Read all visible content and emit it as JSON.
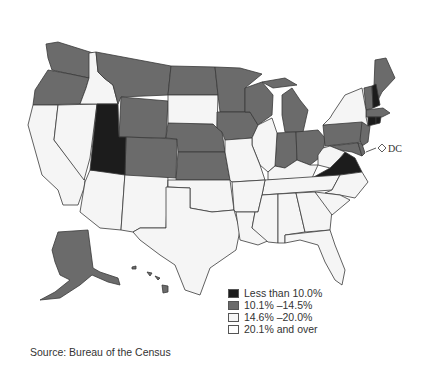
{
  "legend": {
    "items": [
      {
        "label": "Less than 10.0%",
        "color": "#1c1c1c",
        "class": "lt10"
      },
      {
        "label": "10.1% –14.5%",
        "color": "#6b6b6b",
        "class": "c10_14"
      },
      {
        "label": "14.6% –20.0%",
        "color": "#f5f5f5",
        "class": "c14_20"
      },
      {
        "label": "20.1% and over",
        "color": "#ffffff",
        "class": "gt20"
      }
    ]
  },
  "annotation": {
    "dc_label": "DC"
  },
  "source": "Source: Bureau of the Census",
  "states": {
    "less_than_10": [
      "UT",
      "NH",
      "CT",
      "RI",
      "VA"
    ],
    "10_1_to_14_5": [
      "WA",
      "OR",
      "MT",
      "ND",
      "WY",
      "NE",
      "KS",
      "CO",
      "MN",
      "IA",
      "WI",
      "MI",
      "IN",
      "OH",
      "PA",
      "NJ",
      "MD",
      "DE",
      "VT",
      "ME",
      "MA",
      "AK",
      "HI"
    ],
    "light": [
      "CA",
      "NV",
      "ID",
      "AZ",
      "NM",
      "SD",
      "OK",
      "TX",
      "MO",
      "AR",
      "LA",
      "IL",
      "KY",
      "TN",
      "MS",
      "AL",
      "GA",
      "FL",
      "SC",
      "NC",
      "WV",
      "NY"
    ]
  }
}
